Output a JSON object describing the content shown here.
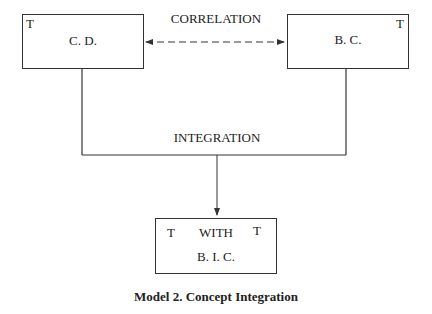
{
  "diagram": {
    "nodes": {
      "left": {
        "label": "C. D.",
        "marker": "T"
      },
      "right": {
        "label": "B. C.",
        "marker": "T"
      },
      "bottom": {
        "marker_left": "T",
        "marker_right": "T",
        "line1": "WITH",
        "line2": "B. I. C."
      }
    },
    "edges": {
      "correlation": {
        "label": "CORRELATION",
        "style": "dashed",
        "direction": "bidirectional"
      },
      "integration": {
        "label": "INTEGRATION",
        "style": "solid",
        "direction": "down"
      }
    },
    "caption": "Model 2. Concept Integration"
  }
}
